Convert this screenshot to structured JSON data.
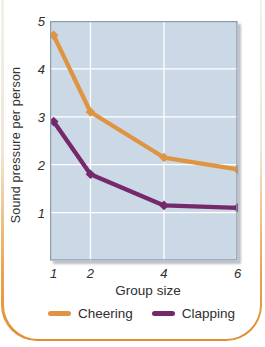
{
  "figure": {
    "page_background": "#ffffff",
    "card_border_color_bottom": "#df8e35",
    "card_border_color_top": "#f3f2f0"
  },
  "chart_data": {
    "type": "line",
    "title": "",
    "xlabel": "Group size",
    "ylabel": "Sound pressure per person",
    "x_ticks": [
      1,
      2,
      4,
      6
    ],
    "y_ticks": [
      1,
      2,
      3,
      4,
      5
    ],
    "xlim": [
      0.9,
      6
    ],
    "ylim": [
      0,
      5
    ],
    "grid": true,
    "plot_bg": "#cbd8e5",
    "grid_color": "#ffffff",
    "plot_border_color": "#8d9cab",
    "tick_style": "italic",
    "legend_position": "bottom",
    "series": [
      {
        "name": "Cheering",
        "color": "#de9440",
        "x": [
          1,
          2,
          4,
          6
        ],
        "values": [
          4.7,
          3.1,
          2.15,
          1.9
        ]
      },
      {
        "name": "Clapping",
        "color": "#76296a",
        "x": [
          1,
          2,
          4,
          6
        ],
        "values": [
          2.9,
          1.8,
          1.15,
          1.1
        ]
      }
    ]
  }
}
